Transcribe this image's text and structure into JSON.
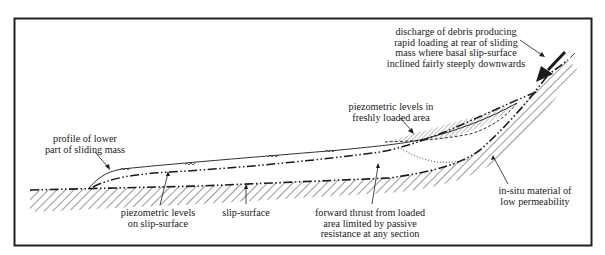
{
  "labels": {
    "discharge": {
      "lines": [
        "discharge of debris producing",
        "rapid loading at rear of sliding",
        "mass where basal slip-surface",
        "inclined fairly steeply downwards"
      ]
    },
    "piezo_fresh": {
      "lines": [
        "piezometric levels in",
        "freshly loaded area"
      ]
    },
    "profile": {
      "lines": [
        "profile of lower",
        "part of sliding mass"
      ]
    },
    "piezo_slip": {
      "lines": [
        "piezometric levels",
        "on slip-surface"
      ]
    },
    "slip_surface": {
      "lines": [
        "slip-surface"
      ]
    },
    "forward_thrust": {
      "lines": [
        "forward thrust from loaded",
        "area limited by passive",
        "resistance at any section"
      ]
    },
    "in_situ": {
      "lines": [
        "in-situ material of",
        "low permeability"
      ]
    }
  },
  "colors": {
    "ink": "#1a1a1a",
    "frame": "#222222",
    "background": "#ffffff"
  }
}
